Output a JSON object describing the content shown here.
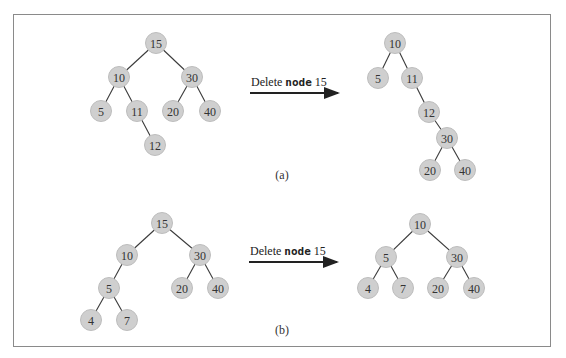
{
  "figure": {
    "panels": [
      {
        "id": "a",
        "caption": "(a)",
        "arrow": {
          "text_pre": "Delete ",
          "text_bold": "node",
          "text_post": " 15"
        },
        "before": {
          "nodes": [
            {
              "key": "15",
              "parent": null
            },
            {
              "key": "10",
              "parent": "15"
            },
            {
              "key": "30",
              "parent": "15"
            },
            {
              "key": "5",
              "parent": "10"
            },
            {
              "key": "11",
              "parent": "10"
            },
            {
              "key": "20",
              "parent": "30"
            },
            {
              "key": "40",
              "parent": "30"
            },
            {
              "key": "12",
              "parent": "11"
            }
          ]
        },
        "after": {
          "nodes": [
            {
              "key": "10",
              "parent": null
            },
            {
              "key": "5",
              "parent": "10"
            },
            {
              "key": "11",
              "parent": "10"
            },
            {
              "key": "12",
              "parent": "11"
            },
            {
              "key": "30",
              "parent": "12"
            },
            {
              "key": "20",
              "parent": "30"
            },
            {
              "key": "40",
              "parent": "30"
            }
          ]
        }
      },
      {
        "id": "b",
        "caption": "(b)",
        "arrow": {
          "text_pre": "Delete ",
          "text_bold": "node",
          "text_post": " 15"
        },
        "before": {
          "nodes": [
            {
              "key": "15",
              "parent": null
            },
            {
              "key": "10",
              "parent": "15"
            },
            {
              "key": "30",
              "parent": "15"
            },
            {
              "key": "5",
              "parent": "10"
            },
            {
              "key": "20",
              "parent": "30"
            },
            {
              "key": "40",
              "parent": "30"
            },
            {
              "key": "4",
              "parent": "5"
            },
            {
              "key": "7",
              "parent": "5"
            }
          ]
        },
        "after": {
          "nodes": [
            {
              "key": "10",
              "parent": null
            },
            {
              "key": "5",
              "parent": "10"
            },
            {
              "key": "30",
              "parent": "10"
            },
            {
              "key": "4",
              "parent": "5"
            },
            {
              "key": "7",
              "parent": "5"
            },
            {
              "key": "20",
              "parent": "30"
            },
            {
              "key": "40",
              "parent": "30"
            }
          ]
        }
      }
    ]
  }
}
